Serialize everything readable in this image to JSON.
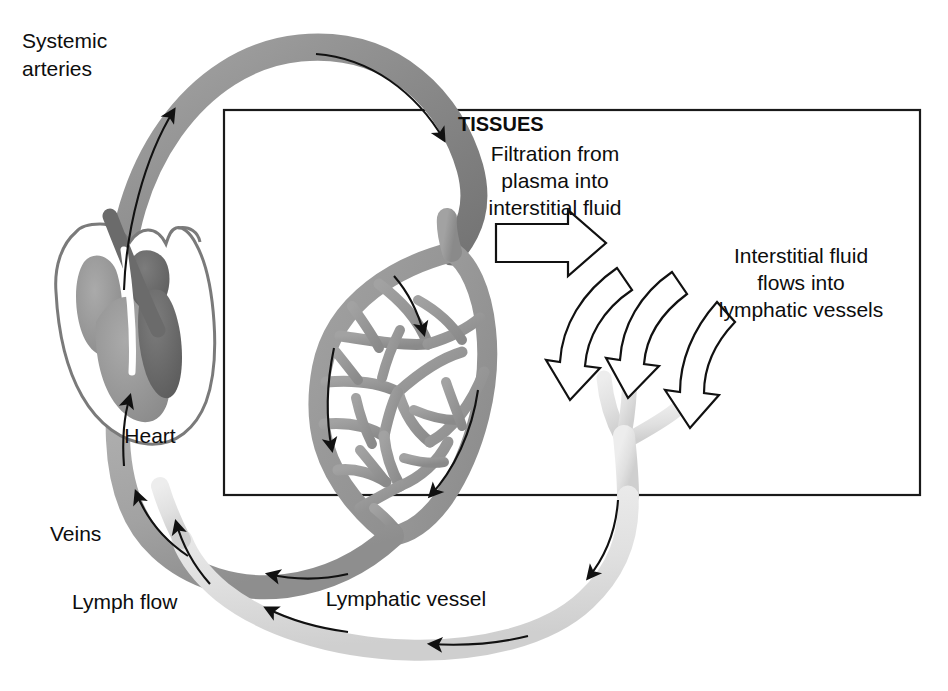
{
  "figure": {
    "background_color": "#ffffff"
  },
  "labels": {
    "systemic_arteries_line1": "Systemic",
    "systemic_arteries_line2": "arteries",
    "heart": "Heart",
    "veins": "Veins",
    "lymph_flow": "Lymph flow",
    "lymphatic_vessel": "Lymphatic vessel",
    "tissues": "TISSUES",
    "filtration_line1": "Filtration from",
    "filtration_line2": "plasma into",
    "filtration_line3": "interstitial fluid",
    "interstitial_line1": "Interstitial fluid",
    "interstitial_line2": "flows into",
    "interstitial_line3": "lymphatic vessels"
  },
  "colors": {
    "artery": "#8f8f8f",
    "artery_dark": "#6e6e6e",
    "vein": "#a8a8a8",
    "capillary": "#9a9a9a",
    "lymph": "#e2e2e2",
    "lymph_edge": "#c9c9c9",
    "heart_outline": "#6b6b6b",
    "heart_chamber_light": "#9d9d9d",
    "heart_chamber_dark": "#6a6a6a",
    "stroke": "#111111",
    "box_border": "#1a1a1a",
    "background": "#ffffff"
  },
  "tissue_box": {
    "x": 224,
    "y": 110,
    "width": 696,
    "height": 385
  },
  "structures": [
    {
      "name": "heart",
      "label": "Heart"
    },
    {
      "name": "systemic-arteries",
      "label": "Systemic arteries"
    },
    {
      "name": "capillary-bed",
      "label": "Capillary network"
    },
    {
      "name": "veins",
      "label": "Veins"
    },
    {
      "name": "lymphatic-capillary",
      "label": "Lymphatic capillary"
    },
    {
      "name": "lymphatic-vessel",
      "label": "Lymphatic vessel"
    }
  ],
  "flow_arrows": {
    "filtration_count": 1,
    "interstitial_count": 3,
    "artery_flow_count": 3,
    "vein_flow_count": 3,
    "lymph_flow_count": 4
  }
}
